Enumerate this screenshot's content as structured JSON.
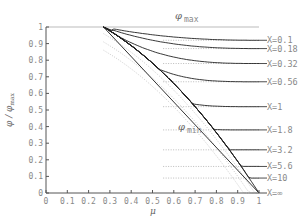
{
  "chart_data": {
    "type": "line",
    "title": "",
    "xlabel": "μ",
    "ylabel": "φ / φ_max",
    "xlim": [
      0,
      1
    ],
    "ylim": [
      0,
      1
    ],
    "xticks": [
      "0",
      "0.1",
      "0.2",
      "0.3",
      "0.4",
      "0.5",
      "0.6",
      "0.7",
      "0.8",
      "0.9",
      "1"
    ],
    "yticks": [
      "0",
      "0.1",
      "0.2",
      "0.3",
      "0.4",
      "0.5",
      "0.6",
      "0.7",
      "0.8",
      "0.9",
      "1"
    ],
    "grid": false,
    "annotations": {
      "phi_max": {
        "symbol": "φ",
        "sub": "max"
      },
      "phi_min": {
        "symbol": "φ",
        "sub": "min"
      }
    },
    "mu_start": 0.27,
    "reference_lines": [
      {
        "name": "phi_max",
        "points": [
          [
            0,
            1
          ],
          [
            1,
            1
          ]
        ]
      },
      {
        "name": "phi_min",
        "points": [
          [
            0.27,
            1
          ],
          [
            1,
            0
          ]
        ]
      }
    ],
    "series": [
      {
        "name": "X=0.1",
        "label": "X=0.1",
        "end_value": 0.92
      },
      {
        "name": "X=0.18",
        "label": "X=0.18",
        "end_value": 0.87
      },
      {
        "name": "X=0.32",
        "label": "X=0.32",
        "end_value": 0.78
      },
      {
        "name": "X=0.56",
        "label": "X=0.56",
        "end_value": 0.67
      },
      {
        "name": "X=1",
        "label": "X=1",
        "end_value": 0.52
      },
      {
        "name": "X=1.8",
        "label": "X=1.8",
        "end_value": 0.38
      },
      {
        "name": "X=3.2",
        "label": "X=3.2",
        "end_value": 0.26
      },
      {
        "name": "X=5.6",
        "label": "X=5.6",
        "end_value": 0.16
      },
      {
        "name": "X=10",
        "label": "X=10",
        "end_value": 0.09
      },
      {
        "name": "X=inf",
        "label": "X=∞",
        "end_value": 0.0
      }
    ]
  }
}
